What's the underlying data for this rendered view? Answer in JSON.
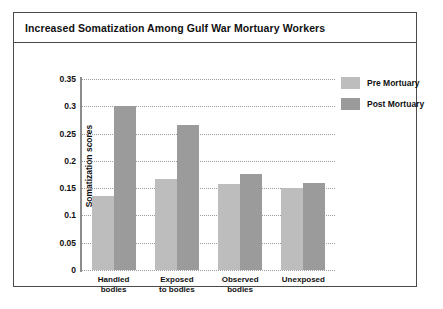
{
  "figure": {
    "title": "Increased Somatization Among Gulf War Mortuary Workers"
  },
  "colors": {
    "pre_mortuary": "#bdbdbd",
    "post_mortuary": "#9b9b9b",
    "axis": "#8c8c8c",
    "grid": "#9c9c9c",
    "border": "#4a4a4a",
    "text": "#111111",
    "background": "#ffffff"
  },
  "chart_data": {
    "type": "bar",
    "title": "Increased Somatization Among Gulf War Mortuary Workers",
    "subtitle": "",
    "xlabel": "",
    "ylabel": "Somatization scores",
    "categories": [
      "Handled bodies",
      "Exposed to bodies",
      "Observed bodies",
      "Unexposed"
    ],
    "category_lines": [
      [
        "Handled",
        "bodies"
      ],
      [
        "Exposed",
        "to bodies"
      ],
      [
        "Observed",
        "bodies"
      ],
      [
        "Unexposed"
      ]
    ],
    "series": [
      {
        "name": "Pre Mortuary",
        "color": "#bdbdbd",
        "values": [
          0.135,
          0.167,
          0.157,
          0.15
        ]
      },
      {
        "name": "Post Mortuary",
        "color": "#9b9b9b",
        "values": [
          0.3,
          0.265,
          0.176,
          0.159
        ]
      }
    ],
    "ylim": [
      0,
      0.35
    ],
    "yticks": [
      0,
      0.05,
      0.1,
      0.15,
      0.2,
      0.25,
      0.3,
      0.35
    ],
    "ytick_labels": [
      "0",
      "0.05",
      "0.1",
      "0.15",
      "0.2",
      "0.25",
      "0.3",
      "0.35"
    ],
    "grid": true,
    "grid_style": "dotted horizontal",
    "legend_position": "top-right",
    "legend": [
      "Pre Mortuary",
      "Post Mortuary"
    ]
  }
}
